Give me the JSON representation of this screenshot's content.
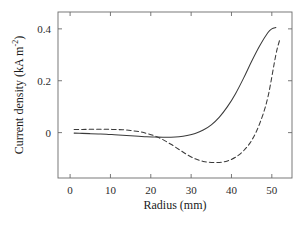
{
  "chart_data": {
    "type": "line",
    "title": "",
    "xlabel": "Radius (mm)",
    "ylabel_prefix": "Current density (kA m",
    "ylabel_exponent": "-2",
    "ylabel_suffix": ")",
    "ylabel": "Current density (kA m^-2)",
    "xlim": [
      -3,
      55
    ],
    "ylim": [
      -0.175,
      0.465
    ],
    "xticks": [
      0,
      10,
      20,
      30,
      40,
      50
    ],
    "xtick_labels": [
      "0",
      "10",
      "20",
      "30",
      "40",
      "50"
    ],
    "yticks": [
      0,
      0.2,
      0.4
    ],
    "ytick_labels": [
      "0",
      "0.2",
      "0.4"
    ],
    "grid": false,
    "legend": null,
    "frame": "full-box",
    "tick_direction": "in",
    "series": [
      {
        "name": "solid",
        "style": "solid",
        "color": "#3a3a3a",
        "x": [
          1,
          3,
          5,
          7,
          9,
          11,
          13,
          15,
          17,
          19,
          21,
          23,
          25,
          27,
          29,
          31,
          33,
          35,
          37,
          39,
          41,
          43,
          45,
          47,
          49,
          50,
          51
        ],
        "y": [
          -0.002,
          -0.003,
          -0.004,
          -0.005,
          -0.006,
          -0.008,
          -0.01,
          -0.012,
          -0.014,
          -0.016,
          -0.017,
          -0.018,
          -0.018,
          -0.016,
          -0.011,
          -0.003,
          0.01,
          0.03,
          0.06,
          0.1,
          0.15,
          0.21,
          0.275,
          0.335,
          0.385,
          0.4,
          0.405
        ]
      },
      {
        "name": "dashed",
        "style": "dashed",
        "color": "#3a3a3a",
        "x": [
          1,
          3,
          5,
          7,
          9,
          11,
          13,
          15,
          17,
          19,
          21,
          23,
          25,
          27,
          29,
          31,
          33,
          35,
          37,
          39,
          41,
          43,
          45,
          47,
          49,
          51,
          52
        ],
        "y": [
          0.012,
          0.012,
          0.013,
          0.013,
          0.013,
          0.012,
          0.011,
          0.008,
          0.004,
          -0.003,
          -0.013,
          -0.027,
          -0.045,
          -0.065,
          -0.085,
          -0.101,
          -0.111,
          -0.115,
          -0.115,
          -0.109,
          -0.095,
          -0.07,
          -0.03,
          0.035,
          0.135,
          0.3,
          0.36
        ]
      }
    ]
  }
}
